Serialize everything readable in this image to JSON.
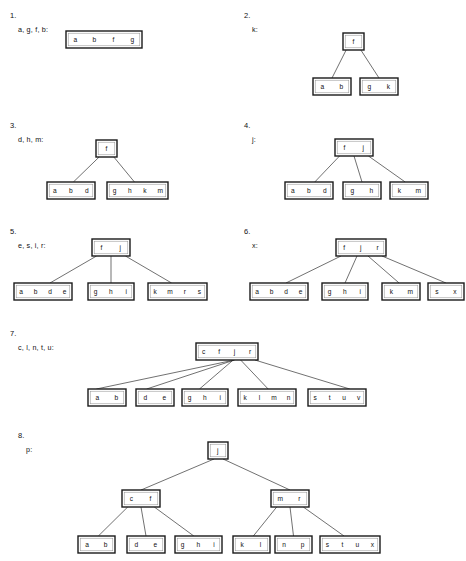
{
  "page": {
    "background_color": "#ffffff",
    "node_border_color": "#1a1a1a",
    "edge_color": "#333333",
    "text_color": "#111111"
  },
  "items": [
    {
      "number": "1.",
      "keys_label": "a, g, f, b:",
      "num_pos": [
        10,
        12
      ],
      "keys_pos": [
        18,
        26
      ],
      "tree": {
        "origin": [
          0,
          0
        ],
        "nodes": [
          {
            "id": "n1",
            "keys": [
              "a",
              "b",
              "f",
              "g"
            ],
            "x": 66,
            "y": 31,
            "w": 76,
            "h": 17
          }
        ],
        "edges": []
      }
    },
    {
      "number": "2.",
      "keys_label": "k:",
      "num_pos": [
        244,
        12
      ],
      "keys_pos": [
        252,
        26
      ],
      "tree": {
        "origin": [
          0,
          0
        ],
        "nodes": [
          {
            "id": "r",
            "keys": [
              "f"
            ],
            "x": 343,
            "y": 33,
            "w": 21,
            "h": 17
          },
          {
            "id": "c1",
            "keys": [
              "a",
              "b"
            ],
            "x": 313,
            "y": 78,
            "w": 38,
            "h": 17
          },
          {
            "id": "c2",
            "keys": [
              "g",
              "k"
            ],
            "x": 360,
            "y": 78,
            "w": 38,
            "h": 17
          }
        ],
        "edges": [
          {
            "from": "r",
            "fx": 0.15,
            "to": "c1",
            "tx": 0.5
          },
          {
            "from": "r",
            "fx": 0.85,
            "to": "c2",
            "tx": 0.5
          }
        ]
      }
    },
    {
      "number": "3.",
      "keys_label": "d, h, m:",
      "num_pos": [
        10,
        122
      ],
      "keys_pos": [
        18,
        136
      ],
      "tree": {
        "origin": [
          0,
          0
        ],
        "nodes": [
          {
            "id": "r",
            "keys": [
              "f"
            ],
            "x": 96,
            "y": 140,
            "w": 21,
            "h": 17
          },
          {
            "id": "c1",
            "keys": [
              "a",
              "b",
              "d"
            ],
            "x": 47,
            "y": 182,
            "w": 48,
            "h": 17
          },
          {
            "id": "c2",
            "keys": [
              "g",
              "h",
              "k",
              "m"
            ],
            "x": 107,
            "y": 182,
            "w": 61,
            "h": 17
          }
        ],
        "edges": [
          {
            "from": "r",
            "fx": 0.15,
            "to": "c1",
            "tx": 0.55
          },
          {
            "from": "r",
            "fx": 0.85,
            "to": "c2",
            "tx": 0.45
          }
        ]
      }
    },
    {
      "number": "4.",
      "keys_label": "j:",
      "num_pos": [
        244,
        122
      ],
      "keys_pos": [
        252,
        136
      ],
      "tree": {
        "origin": [
          0,
          0
        ],
        "nodes": [
          {
            "id": "r",
            "keys": [
              "f",
              "j"
            ],
            "x": 335,
            "y": 139,
            "w": 38,
            "h": 17
          },
          {
            "id": "c1",
            "keys": [
              "a",
              "b",
              "d"
            ],
            "x": 285,
            "y": 182,
            "w": 48,
            "h": 17
          },
          {
            "id": "c2",
            "keys": [
              "g",
              "h"
            ],
            "x": 343,
            "y": 182,
            "w": 38,
            "h": 17
          },
          {
            "id": "c3",
            "keys": [
              "k",
              "m"
            ],
            "x": 390,
            "y": 182,
            "w": 38,
            "h": 17
          }
        ],
        "edges": [
          {
            "from": "r",
            "fx": 0.12,
            "to": "c1",
            "tx": 0.62
          },
          {
            "from": "r",
            "fx": 0.5,
            "to": "c2",
            "tx": 0.5
          },
          {
            "from": "r",
            "fx": 0.88,
            "to": "c3",
            "tx": 0.4
          }
        ]
      }
    },
    {
      "number": "5.",
      "keys_label": "e, s, i, r:",
      "num_pos": [
        10,
        228
      ],
      "keys_pos": [
        18,
        242
      ],
      "tree": {
        "origin": [
          0,
          0
        ],
        "nodes": [
          {
            "id": "r",
            "keys": [
              "f",
              "j"
            ],
            "x": 92,
            "y": 239,
            "w": 38,
            "h": 17
          },
          {
            "id": "c1",
            "keys": [
              "a",
              "b",
              "d",
              "e"
            ],
            "x": 14,
            "y": 283,
            "w": 58,
            "h": 17
          },
          {
            "id": "c2",
            "keys": [
              "g",
              "h",
              "i"
            ],
            "x": 88,
            "y": 283,
            "w": 46,
            "h": 17
          },
          {
            "id": "c3",
            "keys": [
              "k",
              "m",
              "r",
              "s"
            ],
            "x": 148,
            "y": 283,
            "w": 59,
            "h": 17
          }
        ],
        "edges": [
          {
            "from": "r",
            "fx": 0.12,
            "to": "c1",
            "tx": 0.62
          },
          {
            "from": "r",
            "fx": 0.5,
            "to": "c2",
            "tx": 0.5
          },
          {
            "from": "r",
            "fx": 0.88,
            "to": "c3",
            "tx": 0.4
          }
        ]
      }
    },
    {
      "number": "6.",
      "keys_label": "x:",
      "num_pos": [
        244,
        228
      ],
      "keys_pos": [
        252,
        242
      ],
      "tree": {
        "origin": [
          0,
          0
        ],
        "nodes": [
          {
            "id": "r",
            "keys": [
              "f",
              "j",
              "r"
            ],
            "x": 336,
            "y": 239,
            "w": 50,
            "h": 17
          },
          {
            "id": "c1",
            "keys": [
              "a",
              "b",
              "d",
              "e"
            ],
            "x": 250,
            "y": 283,
            "w": 58,
            "h": 17
          },
          {
            "id": "c2",
            "keys": [
              "g",
              "h",
              "i"
            ],
            "x": 322,
            "y": 283,
            "w": 46,
            "h": 17
          },
          {
            "id": "c3",
            "keys": [
              "k",
              "m"
            ],
            "x": 382,
            "y": 283,
            "w": 38,
            "h": 17
          },
          {
            "id": "c4",
            "keys": [
              "s",
              "x"
            ],
            "x": 428,
            "y": 283,
            "w": 36,
            "h": 17
          }
        ],
        "edges": [
          {
            "from": "r",
            "fx": 0.1,
            "to": "c1",
            "tx": 0.62
          },
          {
            "from": "r",
            "fx": 0.42,
            "to": "c2",
            "tx": 0.5
          },
          {
            "from": "r",
            "fx": 0.64,
            "to": "c3",
            "tx": 0.45
          },
          {
            "from": "r",
            "fx": 0.92,
            "to": "c4",
            "tx": 0.5
          }
        ]
      }
    },
    {
      "number": "7.",
      "keys_label": "c, l, n, t, u:",
      "num_pos": [
        10,
        330
      ],
      "keys_pos": [
        18,
        344
      ],
      "tree": {
        "origin": [
          0,
          0
        ],
        "nodes": [
          {
            "id": "r",
            "keys": [
              "c",
              "f",
              "j",
              "r"
            ],
            "x": 196,
            "y": 343,
            "w": 62,
            "h": 17
          },
          {
            "id": "c1",
            "keys": [
              "a",
              "b"
            ],
            "x": 88,
            "y": 389,
            "w": 38,
            "h": 17
          },
          {
            "id": "c2",
            "keys": [
              "d",
              "e"
            ],
            "x": 136,
            "y": 389,
            "w": 38,
            "h": 17
          },
          {
            "id": "c3",
            "keys": [
              "g",
              "h",
              "i"
            ],
            "x": 182,
            "y": 389,
            "w": 46,
            "h": 17
          },
          {
            "id": "c4",
            "keys": [
              "k",
              "l",
              "m",
              "n"
            ],
            "x": 238,
            "y": 389,
            "w": 58,
            "h": 17
          },
          {
            "id": "c5",
            "keys": [
              "s",
              "t",
              "u",
              "v"
            ],
            "x": 308,
            "y": 389,
            "w": 58,
            "h": 17
          }
        ],
        "edges": [
          {
            "from": "r",
            "fx": 0.62,
            "to": "c1",
            "tx": 0.22
          },
          {
            "from": "r",
            "fx": 0.62,
            "to": "c2",
            "tx": 0.28
          },
          {
            "from": "r",
            "fx": 0.6,
            "to": "c3",
            "tx": 0.38
          },
          {
            "from": "r",
            "fx": 0.72,
            "to": "c4",
            "tx": 0.52
          },
          {
            "from": "r",
            "fx": 0.95,
            "to": "c5",
            "tx": 0.72
          }
        ]
      }
    },
    {
      "number": "8.",
      "keys_label": "p:",
      "num_pos": [
        18,
        432
      ],
      "keys_pos": [
        26,
        446
      ],
      "tree": {
        "origin": [
          0,
          0
        ],
        "nodes": [
          {
            "id": "r",
            "keys": [
              "j"
            ],
            "x": 208,
            "y": 442,
            "w": 20,
            "h": 17
          },
          {
            "id": "i1",
            "keys": [
              "c",
              "f"
            ],
            "x": 122,
            "y": 490,
            "w": 38,
            "h": 17
          },
          {
            "id": "i2",
            "keys": [
              "m",
              "r"
            ],
            "x": 271,
            "y": 490,
            "w": 38,
            "h": 17
          },
          {
            "id": "l1",
            "keys": [
              "a",
              "b"
            ],
            "x": 78,
            "y": 536,
            "w": 37,
            "h": 17
          },
          {
            "id": "l2",
            "keys": [
              "d",
              "e"
            ],
            "x": 127,
            "y": 536,
            "w": 38,
            "h": 17
          },
          {
            "id": "l3",
            "keys": [
              "g",
              "h",
              "i"
            ],
            "x": 175,
            "y": 536,
            "w": 47,
            "h": 17
          },
          {
            "id": "l4",
            "keys": [
              "k",
              "l"
            ],
            "x": 233,
            "y": 536,
            "w": 37,
            "h": 17
          },
          {
            "id": "l5",
            "keys": [
              "n",
              "p"
            ],
            "x": 275,
            "y": 536,
            "w": 37,
            "h": 17
          },
          {
            "id": "l6",
            "keys": [
              "s",
              "t",
              "u",
              "x"
            ],
            "x": 320,
            "y": 536,
            "w": 60,
            "h": 17
          }
        ],
        "edges": [
          {
            "from": "r",
            "fx": 0.3,
            "to": "i1",
            "tx": 0.5
          },
          {
            "from": "r",
            "fx": 0.75,
            "to": "i2",
            "tx": 0.5
          },
          {
            "from": "i1",
            "fx": 0.15,
            "to": "l1",
            "tx": 0.55
          },
          {
            "from": "i1",
            "fx": 0.5,
            "to": "l2",
            "tx": 0.5
          },
          {
            "from": "i1",
            "fx": 0.85,
            "to": "l3",
            "tx": 0.4
          },
          {
            "from": "i2",
            "fx": 0.15,
            "to": "l4",
            "tx": 0.55
          },
          {
            "from": "i2",
            "fx": 0.5,
            "to": "l5",
            "tx": 0.5
          },
          {
            "from": "i2",
            "fx": 0.85,
            "to": "l6",
            "tx": 0.4
          }
        ]
      }
    }
  ]
}
